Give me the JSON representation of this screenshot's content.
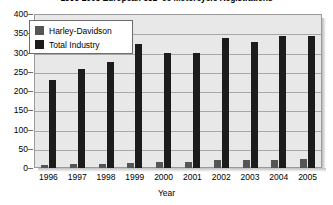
{
  "chart_data": {
    "type": "bar",
    "title": "1996-2005 European 651+cc Motorcycle Registrations",
    "xlabel": "Year",
    "ylabel": "",
    "categories": [
      "1996",
      "1997",
      "1998",
      "1999",
      "2000",
      "2001",
      "2002",
      "2003",
      "2004",
      "2005"
    ],
    "series": [
      {
        "name": "Harley-Davidson",
        "color": "#555555",
        "values": [
          8,
          10,
          11,
          13,
          15,
          16,
          20,
          21,
          22,
          24
        ]
      },
      {
        "name": "Total Industry",
        "color": "#1c1c1c",
        "values": [
          228,
          258,
          275,
          322,
          300,
          300,
          338,
          328,
          344,
          342
        ]
      }
    ],
    "ylim": [
      0,
      400
    ],
    "ytick_step": 50,
    "yticks": [
      "400",
      "350",
      "300",
      "250",
      "200",
      "150",
      "100",
      "50",
      "0"
    ],
    "grid": true,
    "legend_position": "top-left-inside"
  },
  "legend": {
    "items": [
      {
        "label": "Harley-Davidson"
      },
      {
        "label": "Total Industry"
      }
    ]
  }
}
